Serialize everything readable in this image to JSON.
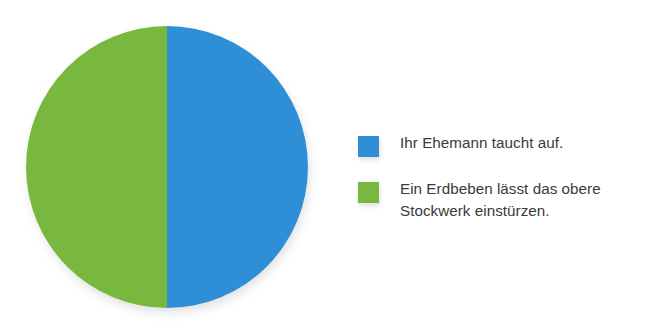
{
  "chart_data": {
    "type": "pie",
    "title": "",
    "subtitle": "",
    "xlabel": "",
    "ylabel": "",
    "grid": false,
    "legend_position": "right",
    "categories": [
      "Ihr Ehemann taucht auf.",
      "Ein Erdbeben lässt das obere Stockwerk einstürzen."
    ],
    "values": [
      50,
      50
    ],
    "value_unit": "%",
    "colors": [
      "#2e8fd6",
      "#78b83e"
    ],
    "slices": [
      {
        "label": "Ihr Ehemann taucht auf.",
        "value": 50,
        "color": "#2e8fd6",
        "start_angle_deg": 0,
        "end_angle_deg": 180,
        "position": "right-half"
      },
      {
        "label": "Ein Erdbeben lässt das obere Stockwerk einstürzen.",
        "value": 50,
        "color": "#78b83e",
        "start_angle_deg": 180,
        "end_angle_deg": 360,
        "position": "left-half"
      }
    ]
  },
  "pie": {
    "center_x": 141,
    "center_y": 141,
    "radius": 141,
    "slice_blue_path": "M 141 141 L 141 0 A 141 141 0 0 1 141 282 Z",
    "slice_green_path": "M 141 141 L 141 282 A 141 141 0 0 1 141 0 Z",
    "blue_color": "#2e8fd6",
    "green_color": "#78b83e"
  },
  "legend": {
    "items": [
      {
        "color": "#2e8fd6",
        "swatch_name": "legend-swatch-blue",
        "label": "Ihr Ehemann taucht auf."
      },
      {
        "color": "#78b83e",
        "swatch_name": "legend-swatch-green",
        "label": "Ein Erdbeben lässt das obere\nStockwerk einstürzen."
      }
    ]
  },
  "colors": {
    "background": "#ffffff",
    "text": "#3a3a3a",
    "accent_blue": "#2e8fd6",
    "accent_green": "#78b83e"
  }
}
